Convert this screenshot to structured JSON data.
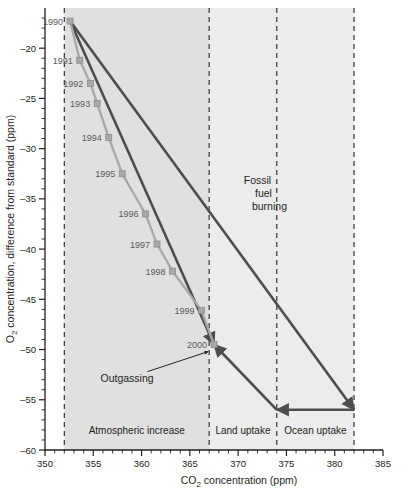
{
  "chart_data": {
    "type": "line",
    "title": "",
    "xlabel": "CO2 concentration (ppm)",
    "xlabel_pre": "CO",
    "xlabel_sub": "2",
    "xlabel_post": " concentration (ppm)",
    "ylabel": "O2 concentration, difference from standard (ppm)",
    "ylabel_pre": "O",
    "ylabel_sub": "2",
    "ylabel_post": " concentration, difference from standard (ppm)",
    "xlim": [
      350,
      385
    ],
    "ylim": [
      -60,
      -16
    ],
    "xticks_major": [
      350,
      355,
      360,
      365,
      370,
      375,
      380,
      385
    ],
    "xticks_minor_step": 1,
    "yticks_major": [
      -20,
      -25,
      -30,
      -35,
      -40,
      -45,
      -50,
      -55,
      -60
    ],
    "yticks_minor_step": 1,
    "grid": false,
    "legend": "none",
    "series": [
      {
        "name": "Observed atmospheric trend 1990-2000",
        "marker": "square",
        "color": "#a9a9a9",
        "points": [
          {
            "label": "1990",
            "x": 352.6,
            "y": -17.3
          },
          {
            "label": "1991",
            "x": 353.6,
            "y": -21.2
          },
          {
            "label": "1992",
            "x": 354.7,
            "y": -23.5
          },
          {
            "label": "1993",
            "x": 355.4,
            "y": -25.5
          },
          {
            "label": "1994",
            "x": 356.6,
            "y": -28.9
          },
          {
            "label": "1995",
            "x": 358.0,
            "y": -32.5
          },
          {
            "label": "1996",
            "x": 360.4,
            "y": -36.5
          },
          {
            "label": "1997",
            "x": 361.6,
            "y": -39.5
          },
          {
            "label": "1998",
            "x": 363.2,
            "y": -42.2
          },
          {
            "label": "1999",
            "x": 366.2,
            "y": -46.1
          },
          {
            "label": "2000",
            "x": 367.5,
            "y": -49.5
          }
        ]
      }
    ],
    "vlines_ppm": [
      352,
      367,
      374,
      382
    ],
    "vectors": [
      {
        "name": "fossil-fuel-burning",
        "from_x": 352.6,
        "from_y": -17.3,
        "to_x": 382.0,
        "to_y": -56.0,
        "arrow": "end"
      },
      {
        "name": "ocean-uptake",
        "from_x": 382.0,
        "from_y": -56.0,
        "to_x": 374.0,
        "to_y": -56.0,
        "arrow": "end"
      },
      {
        "name": "land-uptake",
        "from_x": 374.0,
        "from_y": -56.0,
        "to_x": 367.5,
        "to_y": -49.5,
        "arrow": "end"
      },
      {
        "name": "outgassing-trend",
        "from_x": 352.6,
        "from_y": -17.3,
        "to_x": 367.5,
        "to_y": -49.5,
        "arrow": "end"
      }
    ],
    "annotations": [
      {
        "name": "fossil-fuel-burning-label",
        "text_lines": [
          "Fossil",
          "fuel",
          "burning"
        ],
        "x": 372,
        "y": -33.5
      },
      {
        "name": "outgassing-label",
        "text": "Outgassing",
        "x": 358.5,
        "y": -53.2
      },
      {
        "name": "atmospheric-increase-label",
        "text": "Atmospheric increase",
        "x": 359.5,
        "y": -58.4
      },
      {
        "name": "land-uptake-label",
        "text": "Land uptake",
        "x": 370.5,
        "y": -58.4
      },
      {
        "name": "ocean-uptake-label",
        "text": "Ocean uptake",
        "x": 378.0,
        "y": -58.4
      }
    ],
    "shaded_zones": [
      {
        "name": "atmospheric-increase",
        "from_ppm": 352,
        "to_ppm": 367,
        "color": "#e0e0e0"
      },
      {
        "name": "land-uptake",
        "from_ppm": 367,
        "to_ppm": 374,
        "color": "#ececec"
      },
      {
        "name": "ocean-uptake",
        "from_ppm": 374,
        "to_ppm": 382,
        "color": "#ececec"
      }
    ],
    "colors": {
      "axis": "#231f20",
      "data_line": "#a9a9a9",
      "vector_line": "#4d4d4d",
      "shade_atmos": "#e0e0e0",
      "shade_uptake": "#ececec"
    }
  }
}
